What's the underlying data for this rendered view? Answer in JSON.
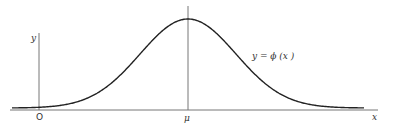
{
  "figure": {
    "type": "normal-distribution-curve",
    "colors": {
      "line": "#222222",
      "axis": "#555555",
      "background": "#ffffff"
    },
    "labels": {
      "origin": "O",
      "mean": "μ",
      "x_axis": "x",
      "y_axis": "y",
      "curve": "y = ϕ (x )"
    },
    "geometry": {
      "axis_y": 110,
      "x_axis_start": 10,
      "x_axis_end": 378,
      "y_axis_x": 39,
      "y_axis_top": 33,
      "mean_x": 188,
      "mean_line_top": 6,
      "peak_y": 19,
      "sigma_px": 48,
      "curve_start_x": 12,
      "curve_end_x": 364,
      "baseline_offset": 2
    }
  }
}
